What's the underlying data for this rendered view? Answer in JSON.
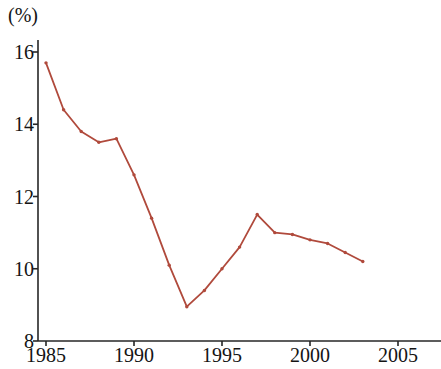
{
  "chart_data": {
    "type": "line",
    "title": "",
    "subtitle": "",
    "unit_label": "(%)",
    "xlabel": "",
    "ylabel": "",
    "xlim": [
      1984.0,
      2006.2
    ],
    "ylim": [
      8,
      16.6
    ],
    "xticks": [
      1985,
      1990,
      1995,
      2000,
      2005
    ],
    "xtick_labels": [
      "1985",
      "1990",
      "1995",
      "2000",
      "2005"
    ],
    "yticks": [
      8,
      10,
      12,
      14,
      16
    ],
    "ytick_labels": [
      "8",
      "10",
      "12",
      "14",
      "16"
    ],
    "grid": false,
    "legend": null,
    "legend_position": "none",
    "line_color": "#b04a3c",
    "marker": "dot",
    "x": [
      1985,
      1986,
      1987,
      1988,
      1989,
      1990,
      1991,
      1992,
      1993,
      1994,
      1995,
      1996,
      1997,
      1998,
      1999,
      2000,
      2001,
      2002,
      2003
    ],
    "values": [
      15.7,
      14.4,
      13.8,
      13.5,
      13.6,
      12.6,
      11.4,
      10.1,
      8.95,
      9.4,
      10.0,
      10.6,
      11.5,
      11.0,
      10.95,
      10.8,
      10.7,
      10.45,
      10.2
    ],
    "series": [
      {
        "name": "rate",
        "values": [
          15.7,
          14.4,
          13.8,
          13.5,
          13.6,
          12.6,
          11.4,
          10.1,
          8.95,
          9.4,
          10.0,
          10.6,
          11.5,
          11.0,
          10.95,
          10.8,
          10.7,
          10.45,
          10.2
        ]
      }
    ],
    "annotations": []
  }
}
